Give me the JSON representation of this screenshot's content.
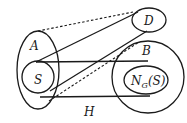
{
  "diagram": {
    "labels": {
      "A": "A",
      "S": "S",
      "D": "D",
      "B": "B",
      "N": "N",
      "N_sub": "G",
      "N_arg": "(S)",
      "H": "H"
    },
    "shapes": [
      {
        "id": "A",
        "type": "ellipse",
        "cx": 38,
        "cy": 70,
        "rx": 21,
        "ry": 39
      },
      {
        "id": "S",
        "type": "circle",
        "cx": 38,
        "cy": 76,
        "r": 16
      },
      {
        "id": "D",
        "type": "ellipse",
        "cx": 149,
        "cy": 20,
        "rx": 17,
        "ry": 12
      },
      {
        "id": "B",
        "type": "circle",
        "cx": 148,
        "cy": 77,
        "r": 36
      },
      {
        "id": "N_G(S)",
        "type": "ellipse",
        "cx": 146,
        "cy": 80,
        "rx": 22,
        "ry": 14
      }
    ],
    "edges": [
      {
        "from": "S",
        "to": "D",
        "style": "solid"
      },
      {
        "from": "S",
        "to": "B",
        "style": "solid",
        "position": "top"
      },
      {
        "from": "S",
        "to": "B",
        "style": "solid",
        "position": "bottom"
      },
      {
        "from": "S",
        "to": "D",
        "style": "solid",
        "position": "lower"
      },
      {
        "from": "A",
        "to": "D",
        "style": "dashed"
      },
      {
        "from": "A",
        "to": "D",
        "style": "dashed",
        "position": "lower"
      }
    ]
  }
}
